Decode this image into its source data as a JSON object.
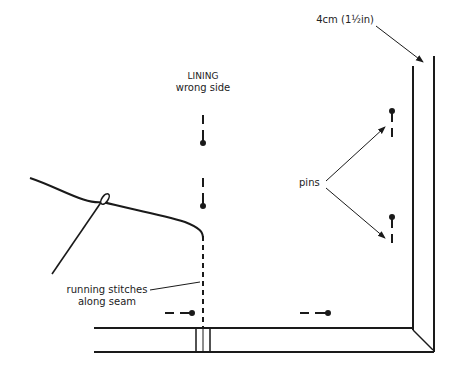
{
  "diagram": {
    "labels": {
      "measurement": "4cm (1½in)",
      "lining_line1": "LINING",
      "lining_line2": "wrong side",
      "pins": "pins",
      "stitches_line1": "running stitches",
      "stitches_line2": "along seam"
    },
    "elements": {
      "needle": "needle-icon",
      "thread": "thread-line",
      "pins": [
        "pin-icon",
        "pin-icon",
        "pin-icon",
        "pin-icon",
        "pin-icon",
        "pin-icon"
      ],
      "hem": "hem-fold"
    },
    "colors": {
      "ink": "#1a1a1a",
      "background": "#ffffff"
    }
  }
}
